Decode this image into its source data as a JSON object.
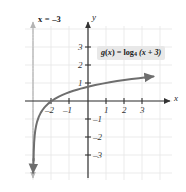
{
  "chart_data": {
    "type": "line",
    "title": "",
    "function_label": "g(x) = log₄ (x + 3)",
    "function_label_parts": {
      "name": "g",
      "arg": "x",
      "equals": "=",
      "log": "log",
      "base": "4",
      "inner": "(x + 3)"
    },
    "asymptote_label": "x = –3",
    "asymptote_x": -3,
    "xlabel": "x",
    "ylabel": "y",
    "xlim": [
      -3.9,
      3.9
    ],
    "ylim": [
      -3.8,
      3.7
    ],
    "xticks": [
      -2,
      -1,
      1,
      2,
      3
    ],
    "yticks": [
      3,
      2,
      1,
      -1,
      -2,
      -3
    ],
    "xtick_labels": [
      "–2",
      "–1",
      "1",
      "2",
      "3"
    ],
    "ytick_labels": [
      "3",
      "2",
      "1",
      "–1",
      "–2",
      "–3"
    ],
    "grid": true,
    "legend": "none",
    "x_intercept": -2,
    "y_intercept": 0.7925,
    "points": [
      {
        "x": -2.99,
        "y": -3.32
      },
      {
        "x": -2.98,
        "y": -2.82
      },
      {
        "x": -2.96,
        "y": -2.32
      },
      {
        "x": -2.93,
        "y": -1.92
      },
      {
        "x": -2.9,
        "y": -1.66
      },
      {
        "x": -2.85,
        "y": -1.37
      },
      {
        "x": -2.8,
        "y": -1.16
      },
      {
        "x": -2.7,
        "y": -0.87
      },
      {
        "x": -2.6,
        "y": -0.66
      },
      {
        "x": -2.5,
        "y": -0.5
      },
      {
        "x": -2.4,
        "y": -0.37
      },
      {
        "x": -2.3,
        "y": -0.26
      },
      {
        "x": -2.2,
        "y": -0.16
      },
      {
        "x": -2.1,
        "y": -0.076
      },
      {
        "x": -2.0,
        "y": 0.0
      },
      {
        "x": -1.8,
        "y": 0.131
      },
      {
        "x": -1.6,
        "y": 0.242
      },
      {
        "x": -1.4,
        "y": 0.337
      },
      {
        "x": -1.2,
        "y": 0.421
      },
      {
        "x": -1.0,
        "y": 0.5
      },
      {
        "x": -0.8,
        "y": 0.567
      },
      {
        "x": -0.6,
        "y": 0.629
      },
      {
        "x": -0.4,
        "y": 0.686
      },
      {
        "x": -0.2,
        "y": 0.74
      },
      {
        "x": 0.0,
        "y": 0.792
      },
      {
        "x": 0.4,
        "y": 0.884
      },
      {
        "x": 0.8,
        "y": 0.966
      },
      {
        "x": 1.2,
        "y": 1.04
      },
      {
        "x": 1.6,
        "y": 1.107
      },
      {
        "x": 2.0,
        "y": 1.161
      },
      {
        "x": 2.4,
        "y": 1.218
      },
      {
        "x": 2.8,
        "y": 1.27
      },
      {
        "x": 3.2,
        "y": 1.319
      },
      {
        "x": 3.6,
        "y": 1.364
      }
    ],
    "colors": {
      "curve": "#6e6e6e",
      "axis": "#333333",
      "grid": "#e4e4e4",
      "asymptote": "#b4b4b4",
      "label_box": "#e8e8e8",
      "text": "#1a1a1a",
      "background": "#ffffff"
    }
  }
}
